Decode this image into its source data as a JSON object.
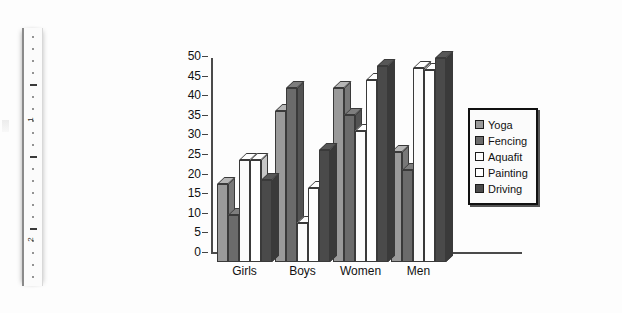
{
  "document": {
    "ruler": {
      "name": "vertical-ruler",
      "marks": [
        "1",
        "2"
      ]
    }
  },
  "legend": {
    "position": "right",
    "items": [
      {
        "label": "Yoga",
        "color": "#9a9a9a"
      },
      {
        "label": "Fencing",
        "color": "#6b6b6b"
      },
      {
        "label": "Aquafit",
        "color": "#fbfbfb"
      },
      {
        "label": "Painting",
        "color": "#ffffff"
      },
      {
        "label": "Driving",
        "color": "#4a4a4a"
      }
    ]
  },
  "chart_data": {
    "type": "bar",
    "title": "",
    "subtitle": "",
    "xlabel": "",
    "ylabel": "",
    "categories": [
      "Girls",
      "Boys",
      "Women",
      "Men"
    ],
    "ylim": [
      0,
      50
    ],
    "yticks": [
      0,
      5,
      10,
      15,
      20,
      25,
      30,
      35,
      40,
      45,
      50
    ],
    "ytick_labels": [
      "0",
      "5",
      "10",
      "15",
      "20",
      "25",
      "30",
      "35",
      "40",
      "45",
      "50"
    ],
    "grid": false,
    "three_d": true,
    "series": [
      {
        "name": "Yoga",
        "color": "#9a9a9a",
        "values": [
          20,
          38.5,
          44.5,
          28
        ]
      },
      {
        "name": "Fencing",
        "color": "#6b6b6b",
        "values": [
          12,
          44.5,
          37.5,
          23.5
        ]
      },
      {
        "name": "Aquafit",
        "color": "#fbfbfb",
        "values": [
          26,
          10,
          33.5,
          49.5
        ]
      },
      {
        "name": "Painting",
        "color": "#ffffff",
        "values": [
          26,
          19,
          46.5,
          49
        ]
      },
      {
        "name": "Driving",
        "color": "#4a4a4a",
        "values": [
          21,
          28.5,
          50,
          52
        ]
      }
    ]
  }
}
